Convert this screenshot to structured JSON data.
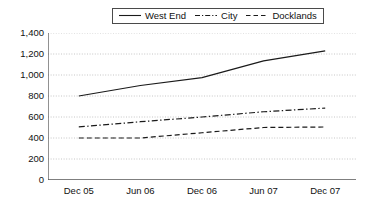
{
  "chart_data": {
    "type": "line",
    "title": "",
    "subtitle": "",
    "xlabel": "",
    "ylabel": "",
    "categories": [
      "Dec 05",
      "Jun 06",
      "Dec 06",
      "Jun 07",
      "Dec 07"
    ],
    "ylim": [
      0,
      1400
    ],
    "ytick_values": [
      0,
      200,
      400,
      600,
      800,
      1000,
      1200,
      1400
    ],
    "ytick_labels": [
      "0",
      "200",
      "400",
      "600",
      "800",
      "1,000",
      "1,200",
      "1,400"
    ],
    "grid": true,
    "grid_style": "horizontal-dotted",
    "legend_position": "top-center",
    "series": [
      {
        "name": "West End",
        "line_style": "solid",
        "color": "#1a1a1a",
        "values": [
          800,
          900,
          975,
          1135,
          1230
        ]
      },
      {
        "name": "City",
        "line_style": "dash-dot",
        "color": "#1a1a1a",
        "values": [
          505,
          555,
          600,
          650,
          685
        ]
      },
      {
        "name": "Docklands",
        "line_style": "dashed",
        "color": "#1a1a1a",
        "values": [
          400,
          400,
          450,
          500,
          505
        ]
      }
    ]
  },
  "legend": {
    "items": [
      {
        "label": "West End"
      },
      {
        "label": "City"
      },
      {
        "label": "Docklands"
      }
    ]
  },
  "axes": {
    "y_labels": [
      "1,400",
      "1,200",
      "1,000",
      "800",
      "600",
      "400",
      "200",
      "0"
    ],
    "x_labels": [
      "Dec 05",
      "Jun 06",
      "Dec 06",
      "Jun 07",
      "Dec 07"
    ]
  },
  "colors": {
    "ink": "#1a1a1a",
    "axis": "#555555",
    "grid": "#b8b8b8",
    "background": "#ffffff"
  }
}
